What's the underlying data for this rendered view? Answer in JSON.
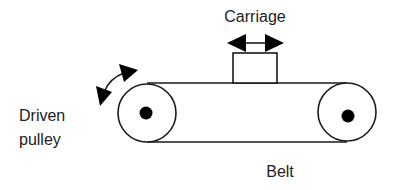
{
  "diagram": {
    "labels": {
      "carriage": "Carriage",
      "driven_pulley_line1": "Driven",
      "driven_pulley_line2": "pulley",
      "belt": "Belt"
    },
    "components": [
      "driven-pulley",
      "idler-pulley",
      "belt",
      "carriage",
      "carriage-motion-arrow",
      "pulley-rotation-arrow"
    ],
    "colors": {
      "stroke": "#1a1a1a",
      "text": "#222222",
      "background": "#ffffff"
    }
  }
}
